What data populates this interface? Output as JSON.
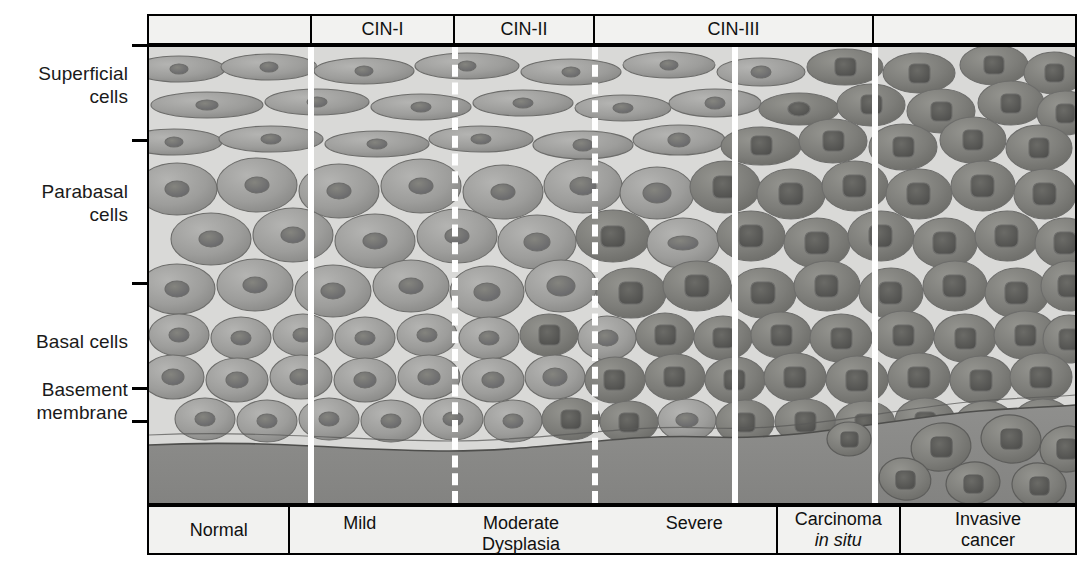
{
  "diagram": {
    "axis_labels": [
      {
        "id": "superficial",
        "text": "Superficial\ncells"
      },
      {
        "id": "parabasal",
        "text": "Parabasal\ncells"
      },
      {
        "id": "basal",
        "text": "Basal cells"
      },
      {
        "id": "basement",
        "text": "Basement\nmembrane"
      }
    ],
    "header_cells": [
      {
        "id": "normal",
        "label": ""
      },
      {
        "id": "cin1",
        "label": "CIN-I"
      },
      {
        "id": "cin2",
        "label": "CIN-II"
      },
      {
        "id": "cin3",
        "label": "CIN-III"
      },
      {
        "id": "invasive",
        "label": ""
      }
    ],
    "footer_cells": [
      {
        "id": "normal",
        "label": "Normal"
      },
      {
        "id": "dysplasia",
        "labels": [
          "Mild",
          "Moderate\nDysplasia",
          "Severe"
        ]
      },
      {
        "id": "cis",
        "line1": "Carcinoma",
        "line2": "in situ"
      },
      {
        "id": "invasive",
        "line1": "Invasive",
        "line2": "cancer"
      }
    ],
    "colors": {
      "background": "#d9d9d7",
      "cell_fill": "#9b9b99",
      "cell_fill_dark": "#7e7e7c",
      "nucleus": "#6f6f6d",
      "nucleus_dark": "#5a5a58",
      "stroma": "#8a8a88",
      "divider": "#ffffff",
      "border": "#000000",
      "header_fill": "#f2f2f0",
      "text": "#1a1a1a"
    }
  }
}
